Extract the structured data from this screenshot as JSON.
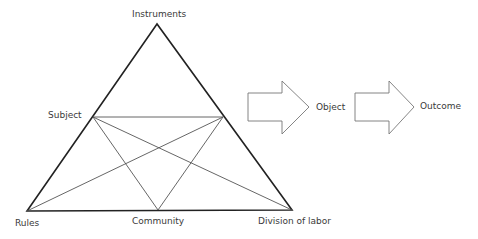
{
  "diagram": {
    "nodes": {
      "instruments": "Instruments",
      "subject": "Subject",
      "rules": "Rules",
      "community": "Community",
      "division_of_labor": "Division of labor",
      "object": "Object",
      "outcome": "Outcome"
    },
    "colors": {
      "outer_triangle": "#222222",
      "inner_lines": "#555555",
      "arrow_outline": "#777777",
      "text": "#3a3a3a"
    }
  }
}
